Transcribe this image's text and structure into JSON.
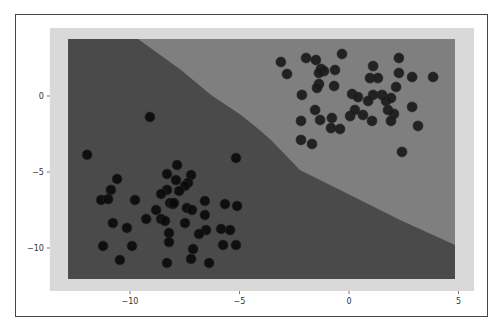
{
  "chart_data": {
    "type": "scatter",
    "title": "",
    "xlabel": "",
    "ylabel": "",
    "xlim": [
      -14.5,
      5.8
    ],
    "ylim": [
      -12.8,
      4.5
    ],
    "grid": false,
    "legend": null,
    "x_ticks": [
      -10,
      -5,
      0,
      5
    ],
    "y_ticks": [
      0,
      -5,
      -10
    ],
    "x_tick_labels": [
      "−10",
      "−5",
      "0",
      "5"
    ],
    "y_tick_labels": [
      "0",
      "−5",
      "−10"
    ],
    "background_region": {
      "x_range": [
        -13.66,
        5.71
      ],
      "y_range": [
        -12.83,
        4.47
      ],
      "color": "#d9d9d9"
    },
    "decision_regions": {
      "extent": {
        "x": [
          -12.83,
          4.84
        ],
        "y": [
          -12.04,
          3.75
        ]
      },
      "class_0_color": "#4a4a4a",
      "class_1_color": "#7f7f7f",
      "boundary": [
        {
          "x": -9.63,
          "y": 3.75
        },
        {
          "x": -7.67,
          "y": 1.71
        },
        {
          "x": -6.3,
          "y": 0.07
        },
        {
          "x": -4.93,
          "y": -1.25
        },
        {
          "x": -4.25,
          "y": -2.04
        },
        {
          "x": -3.56,
          "y": -2.89
        },
        {
          "x": -2.24,
          "y": -4.87
        },
        {
          "x": 0.05,
          "y": -6.51
        },
        {
          "x": 2.33,
          "y": -8.16
        },
        {
          "x": 4.84,
          "y": -9.8
        }
      ]
    },
    "series": [
      {
        "name": "cluster_upper_right",
        "color": "#1a1a1a",
        "points": [
          {
            "x": -3.11,
            "y": 2.24
          },
          {
            "x": -2.83,
            "y": 1.45
          },
          {
            "x": -1.96,
            "y": 2.5
          },
          {
            "x": -1.51,
            "y": 2.37
          },
          {
            "x": -1.28,
            "y": 1.78
          },
          {
            "x": -1.14,
            "y": 1.64
          },
          {
            "x": -1.37,
            "y": 1.51
          },
          {
            "x": -0.64,
            "y": 1.71
          },
          {
            "x": -0.32,
            "y": 2.76
          },
          {
            "x": -1.37,
            "y": 0.79
          },
          {
            "x": -1.46,
            "y": 0.53
          },
          {
            "x": -0.68,
            "y": 0.66
          },
          {
            "x": -2.15,
            "y": 0.07
          },
          {
            "x": 0.14,
            "y": 0.13
          },
          {
            "x": -1.55,
            "y": -0.92
          },
          {
            "x": -1.32,
            "y": -1.58
          },
          {
            "x": -2.19,
            "y": -1.64
          },
          {
            "x": -0.78,
            "y": -1.45
          },
          {
            "x": -0.82,
            "y": -2.11
          },
          {
            "x": -0.41,
            "y": -2.17
          },
          {
            "x": -2.19,
            "y": -2.89
          },
          {
            "x": -1.69,
            "y": -3.16
          },
          {
            "x": 0.05,
            "y": -1.32
          },
          {
            "x": 0.27,
            "y": -0.92
          },
          {
            "x": 2.28,
            "y": 2.5
          },
          {
            "x": 1.1,
            "y": 1.97
          },
          {
            "x": 2.28,
            "y": 1.51
          },
          {
            "x": 0.96,
            "y": 1.18
          },
          {
            "x": 1.32,
            "y": 1.18
          },
          {
            "x": 2.88,
            "y": 1.25
          },
          {
            "x": 3.84,
            "y": 1.25
          },
          {
            "x": 2.15,
            "y": 0.59
          },
          {
            "x": 0.41,
            "y": -0.07
          },
          {
            "x": 1.1,
            "y": 0.07
          },
          {
            "x": 0.87,
            "y": -0.33
          },
          {
            "x": 1.51,
            "y": 0.07
          },
          {
            "x": 1.69,
            "y": -0.33
          },
          {
            "x": 1.92,
            "y": -0.13
          },
          {
            "x": 2.88,
            "y": -0.72
          },
          {
            "x": 0.64,
            "y": -1.25
          },
          {
            "x": 1.78,
            "y": -0.92
          },
          {
            "x": 2.05,
            "y": -1.18
          },
          {
            "x": 1.92,
            "y": -1.64
          },
          {
            "x": 1.05,
            "y": -1.64
          },
          {
            "x": 3.15,
            "y": -1.97
          },
          {
            "x": 2.42,
            "y": -3.68
          }
        ]
      },
      {
        "name": "cluster_lower_left",
        "color": "#0a0a0a",
        "points": [
          {
            "x": -9.09,
            "y": -1.38
          },
          {
            "x": -11.96,
            "y": -3.87
          },
          {
            "x": -5.16,
            "y": -4.08
          },
          {
            "x": -7.85,
            "y": -4.54
          },
          {
            "x": -10.59,
            "y": -5.46
          },
          {
            "x": -10.87,
            "y": -6.18
          },
          {
            "x": -11.32,
            "y": -6.84
          },
          {
            "x": -11.0,
            "y": -6.78
          },
          {
            "x": -9.77,
            "y": -6.84
          },
          {
            "x": -8.31,
            "y": -5.13
          },
          {
            "x": -7.9,
            "y": -5.53
          },
          {
            "x": -8.31,
            "y": -6.18
          },
          {
            "x": -8.58,
            "y": -6.45
          },
          {
            "x": -8.81,
            "y": -7.5
          },
          {
            "x": -8.17,
            "y": -7.04
          },
          {
            "x": -8.04,
            "y": -7.11
          },
          {
            "x": -9.26,
            "y": -8.09
          },
          {
            "x": -8.58,
            "y": -8.09
          },
          {
            "x": -8.4,
            "y": -8.22
          },
          {
            "x": -10.78,
            "y": -8.36
          },
          {
            "x": -10.14,
            "y": -8.68
          },
          {
            "x": -8.22,
            "y": -9.01
          },
          {
            "x": -8.22,
            "y": -9.61
          },
          {
            "x": -11.23,
            "y": -9.87
          },
          {
            "x": -9.91,
            "y": -9.87
          },
          {
            "x": -10.46,
            "y": -10.79
          },
          {
            "x": -8.31,
            "y": -10.99
          },
          {
            "x": -7.21,
            "y": -5.2
          },
          {
            "x": -7.35,
            "y": -5.72
          },
          {
            "x": -7.49,
            "y": -5.92
          },
          {
            "x": -7.76,
            "y": -6.25
          },
          {
            "x": -6.58,
            "y": -6.91
          },
          {
            "x": -7.99,
            "y": -7.04
          },
          {
            "x": -5.66,
            "y": -7.11
          },
          {
            "x": -5.11,
            "y": -7.24
          },
          {
            "x": -7.4,
            "y": -7.37
          },
          {
            "x": -7.17,
            "y": -7.5
          },
          {
            "x": -6.58,
            "y": -7.83
          },
          {
            "x": -7.49,
            "y": -8.36
          },
          {
            "x": -6.53,
            "y": -8.82
          },
          {
            "x": -5.84,
            "y": -8.75
          },
          {
            "x": -5.43,
            "y": -8.82
          },
          {
            "x": -6.85,
            "y": -9.08
          },
          {
            "x": -5.75,
            "y": -9.8
          },
          {
            "x": -5.16,
            "y": -9.8
          },
          {
            "x": -7.12,
            "y": -10.07
          },
          {
            "x": -7.21,
            "y": -10.72
          },
          {
            "x": -6.39,
            "y": -10.99
          }
        ]
      }
    ]
  }
}
